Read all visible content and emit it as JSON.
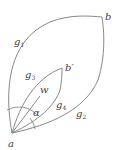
{
  "diagram": {
    "points": {
      "a": "a",
      "b": "b",
      "b_prime": "b′"
    },
    "curves": {
      "g1": {
        "base": "g",
        "sub": "1"
      },
      "g2": {
        "base": "g",
        "sub": "2"
      },
      "g3": {
        "base": "g",
        "sub": "3"
      },
      "g4": {
        "base": "g",
        "sub": "4"
      }
    },
    "vector_label": "w",
    "angle_label": "α",
    "colors": {
      "stroke": "#7a7a7a",
      "text": "#444444",
      "background": "#ffffff"
    }
  }
}
